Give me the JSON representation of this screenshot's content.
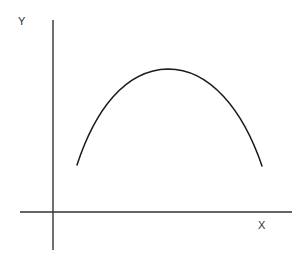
{
  "diagram": {
    "type": "function-plot",
    "axes": {
      "x_label": "X",
      "y_label": "Y",
      "color": "#333333"
    },
    "curve": {
      "shape": "inverted-u",
      "color": "#1a1a1a",
      "start_point_px": [
        77,
        165
      ],
      "peak_point_px": [
        168,
        69
      ],
      "end_point_px": [
        262,
        166
      ]
    }
  }
}
